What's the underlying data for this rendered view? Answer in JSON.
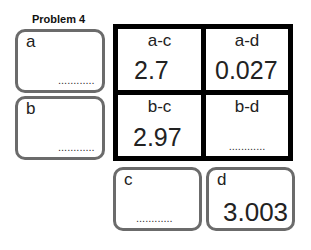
{
  "title": "Problem 4",
  "boxes": {
    "a": {
      "label": "a",
      "value": "",
      "placeholder": "............"
    },
    "b": {
      "label": "b",
      "value": "",
      "placeholder": "............"
    },
    "c": {
      "label": "c",
      "value": "",
      "placeholder": "............"
    },
    "d": {
      "label": "d",
      "value": "3.003"
    }
  },
  "grid": {
    "ac": {
      "header": "a-c",
      "value": "2.7"
    },
    "ad": {
      "header": "a-d",
      "value": "0.027"
    },
    "bc": {
      "header": "b-c",
      "value": "2.97"
    },
    "bd": {
      "header": "b-d",
      "value": "",
      "placeholder": "............"
    }
  }
}
